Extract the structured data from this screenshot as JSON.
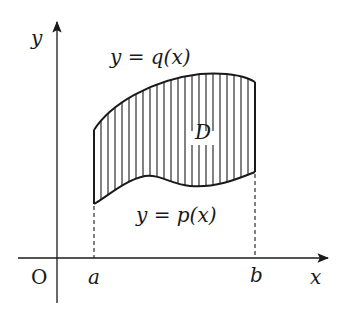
{
  "diagram": {
    "type": "region-between-curves",
    "axes": {
      "x_label": "x",
      "y_label": "y",
      "origin_label": "O"
    },
    "bounds": {
      "left_label": "a",
      "right_label": "b"
    },
    "curves": {
      "upper": {
        "label": "y = q(x)"
      },
      "lower": {
        "label": "y = p(x)"
      }
    },
    "region": {
      "label": "D",
      "fill_style": "vertical hatching"
    },
    "colors": {
      "line": "#1a1a1a",
      "background": "#ffffff"
    }
  }
}
